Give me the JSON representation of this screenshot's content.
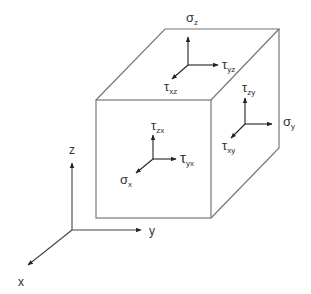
{
  "diagram": {
    "colors": {
      "line": "#555555",
      "cube_edge": "#777777",
      "text": "#333333",
      "background": "#ffffff"
    },
    "cube": {
      "front_face": {
        "x1": 96,
        "y1": 100,
        "x2": 211,
        "y2": 218
      },
      "depth_offset": {
        "dx": 68,
        "dy": -71
      }
    },
    "axes": {
      "origin": [
        72,
        230
      ],
      "z": {
        "label": "z",
        "end": [
          72,
          162
        ]
      },
      "y": {
        "label": "y",
        "end": [
          141,
          230
        ]
      },
      "x": {
        "label": "x",
        "end": [
          28,
          265
        ]
      }
    },
    "faces": {
      "top": {
        "normal_label": {
          "symbol": "σ",
          "sub": "z"
        },
        "shear_right_label": {
          "symbol": "τ",
          "sub": "yz"
        },
        "shear_diag_label": {
          "symbol": "τ",
          "sub": "xz"
        }
      },
      "right": {
        "normal_label": {
          "symbol": "σ",
          "sub": "y"
        },
        "shear_up_label": {
          "symbol": "τ",
          "sub": "zy"
        },
        "shear_diag_label": {
          "symbol": "τ",
          "sub": "xy"
        }
      },
      "front": {
        "normal_label": {
          "symbol": "σ",
          "sub": "x"
        },
        "shear_up_label": {
          "symbol": "τ",
          "sub": "zx"
        },
        "shear_right_label": {
          "symbol": "τ",
          "sub": "yx"
        }
      }
    }
  }
}
